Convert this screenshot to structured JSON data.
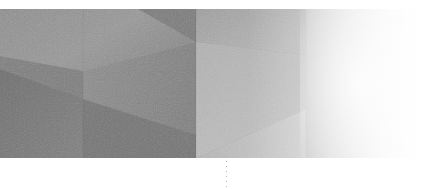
{
  "canvas": {
    "width": 438,
    "height": 189,
    "background": "#ffffff",
    "alt_text": "Abstract grayscale low-poly geometric gradient band"
  },
  "artwork": {
    "name": "abstract-grayscale-geometry",
    "top": 9,
    "left": 0,
    "width": 438,
    "height": 149,
    "description": "Wide horizontal band of angular faceted planes in shades of grey, darkest at the lower left, fading to pure white at the right edge.",
    "grain": "film-grain-noise",
    "palette": {
      "darkest": "#6d6d6d",
      "dark": "#7a7a7a",
      "mid_dark": "#878787",
      "mid": "#949494",
      "mid_light": "#a4a4a4",
      "light": "#b6b6b6",
      "lighter": "#c9c9c9",
      "lightest": "#e2e2e2",
      "white": "#ffffff"
    },
    "facets": [
      {
        "name": "upper-left-plane",
        "fill": "#8f8f8f",
        "points": "0,0 196,0 196,33 83,62 0,47"
      },
      {
        "name": "upper-left-dark-wedge",
        "fill": "#828282",
        "points": "0,47 83,62 83,149 0,149"
      },
      {
        "name": "lower-left-dark-plane",
        "fill": "#747474",
        "points": "0,62 83,90 83,149 0,149"
      },
      {
        "name": "left-mid-plane",
        "fill": "#8a8a8a",
        "points": "83,62 196,33 196,149 83,149"
      },
      {
        "name": "left-lower-triangle",
        "fill": "#7c7c7c",
        "points": "83,90 196,125 196,149 83,149"
      },
      {
        "name": "center-top-dark-triangle",
        "fill": "#7e7e7e",
        "points": "140,0 196,33 252,0"
      },
      {
        "name": "center-right-top-plane",
        "fill": "#9d9d9d",
        "points": "196,0 306,0 306,45 196,33"
      },
      {
        "name": "center-right-plane",
        "fill": "#b0b0b0",
        "points": "196,33 306,45 306,100 196,149"
      },
      {
        "name": "right-upper-plane",
        "fill": "#c2c2c2",
        "points": "306,0 438,0 438,149 306,149"
      },
      {
        "name": "right-lower-wedge",
        "fill": "#b8b8b8",
        "points": "196,149 306,100 306,149"
      }
    ],
    "edges": [
      {
        "name": "vertical-seam-left",
        "x": 83
      },
      {
        "name": "vertical-seam-center",
        "x": 196
      },
      {
        "name": "vertical-seam-right",
        "x": 306
      }
    ]
  },
  "marker": {
    "name": "dotted-tick-marker",
    "x": 226,
    "y": 161,
    "height": 26,
    "color": "#b9b9b9",
    "style": "dotted-vertical"
  }
}
